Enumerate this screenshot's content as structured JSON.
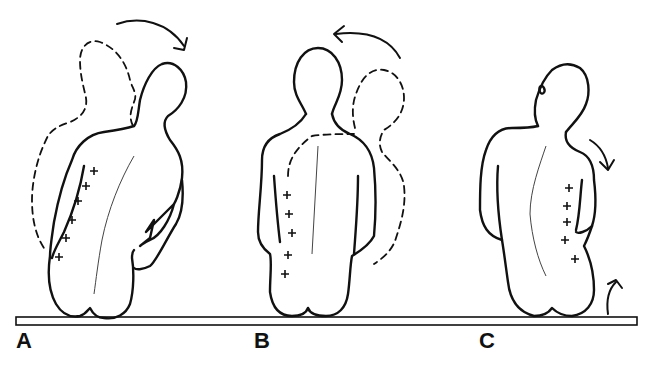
{
  "figure": {
    "panels": [
      {
        "id": "A",
        "label": "A",
        "description": "Seated figure, back view, trunk rotated to the right; dashed outline shows starting position; plus marks along left paraspinal region"
      },
      {
        "id": "B",
        "label": "B",
        "description": "Seated figure, back view, upright; dashed outline shows rotation from right; plus marks along left paraspinal region"
      },
      {
        "id": "C",
        "label": "C",
        "description": "Seated figure, back view, head turned and trunk side-bending; arrows indicate shoulder depression and pelvis elevation on right; plus marks along right paraspinal region"
      }
    ],
    "marker_symbol": "+",
    "marker_counts": {
      "A": 6,
      "B": 5,
      "C": 5
    },
    "colors": {
      "line": "#111111",
      "background": "#ffffff",
      "spine": "#444444"
    }
  }
}
